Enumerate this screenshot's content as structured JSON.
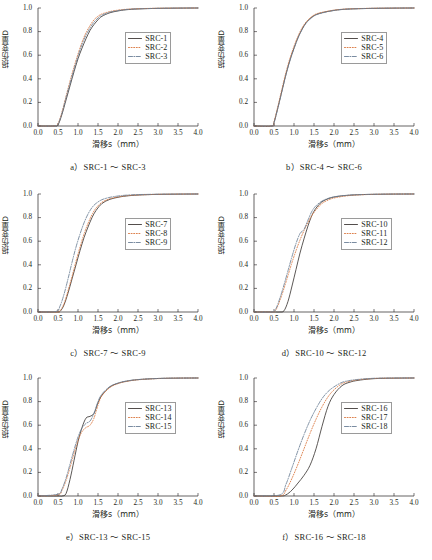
{
  "figure": {
    "axis": {
      "xlabel": "滑移s（mm）",
      "ylabel": "损伤变量D",
      "xticks": [
        "0.0",
        "0.5",
        "1.0",
        "1.5",
        "2.0",
        "2.5",
        "3.0",
        "3.5",
        "4.0"
      ],
      "yticks": [
        "0.0",
        "0.2",
        "0.4",
        "0.6",
        "0.8",
        "1.0"
      ],
      "xlim": [
        0.0,
        4.0
      ],
      "ylim": [
        0.0,
        1.0
      ]
    },
    "colors": {
      "series1": "#3f3a38",
      "series2": "#d9743a",
      "series3": "#6b7f96",
      "axis": "#231f20",
      "legend_border": "#9a9a9a"
    },
    "panels": [
      {
        "caption": "a）SRC-1 ～ SRC-3",
        "legend": [
          "SRC-1",
          "SRC-2",
          "SRC-3"
        ]
      },
      {
        "caption": "b）SRC-4 ～ SRC-6",
        "legend": [
          "SRC-4",
          "SRC-5",
          "SRC-6"
        ]
      },
      {
        "caption": "c）SRC-7 ～ SRC-9",
        "legend": [
          "SRC-7",
          "SRC-8",
          "SRC-9"
        ]
      },
      {
        "caption": "d）SRC-10 ～ SRC-12",
        "legend": [
          "SRC-10",
          "SRC-11",
          "SRC-12"
        ]
      },
      {
        "caption": "e）SRC-13 ～ SRC-15",
        "legend": [
          "SRC-13",
          "SRC-14",
          "SRC-15"
        ]
      },
      {
        "caption": "f）SRC-16 ～ SRC-18",
        "legend": [
          "SRC-16",
          "SRC-17",
          "SRC-18"
        ]
      }
    ]
  },
  "chart_data": [
    {
      "type": "line",
      "panel": "a",
      "title": "a）SRC-1 ～ SRC-3",
      "xlabel": "滑移s（mm）",
      "ylabel": "损伤变量D",
      "xlim": [
        0.0,
        4.0
      ],
      "ylim": [
        0.0,
        1.0
      ],
      "grid": false,
      "legend_position": "center-right",
      "x": [
        0.0,
        0.4,
        0.5,
        0.6,
        0.7,
        0.8,
        0.9,
        1.0,
        1.1,
        1.2,
        1.3,
        1.4,
        1.5,
        1.6,
        1.8,
        2.0,
        2.2,
        2.5,
        3.0,
        3.5,
        4.0
      ],
      "series": [
        {
          "name": "SRC-1",
          "style": "solid",
          "color": "#3f3a38",
          "values": [
            0.0,
            0.0,
            0.01,
            0.1,
            0.22,
            0.34,
            0.46,
            0.57,
            0.66,
            0.74,
            0.81,
            0.86,
            0.9,
            0.93,
            0.96,
            0.975,
            0.985,
            0.992,
            0.997,
            0.999,
            1.0
          ]
        },
        {
          "name": "SRC-2",
          "style": "dotted",
          "color": "#d9743a",
          "values": [
            0.0,
            0.0,
            0.02,
            0.12,
            0.25,
            0.38,
            0.5,
            0.61,
            0.71,
            0.79,
            0.85,
            0.9,
            0.93,
            0.95,
            0.97,
            0.982,
            0.989,
            0.994,
            0.998,
            0.999,
            1.0
          ]
        },
        {
          "name": "SRC-3",
          "style": "dashdot",
          "color": "#6b7f96",
          "values": [
            0.0,
            0.0,
            0.015,
            0.11,
            0.24,
            0.36,
            0.48,
            0.59,
            0.69,
            0.77,
            0.83,
            0.88,
            0.915,
            0.94,
            0.965,
            0.978,
            0.987,
            0.993,
            0.997,
            0.999,
            1.0
          ]
        }
      ]
    },
    {
      "type": "line",
      "panel": "b",
      "title": "b）SRC-4 ～ SRC-6",
      "xlabel": "滑移s（mm）",
      "ylabel": "损伤变量D",
      "xlim": [
        0.0,
        4.0
      ],
      "ylim": [
        0.0,
        1.0
      ],
      "grid": false,
      "legend_position": "center-right",
      "x": [
        0.0,
        0.45,
        0.5,
        0.6,
        0.7,
        0.8,
        0.9,
        1.0,
        1.1,
        1.2,
        1.3,
        1.4,
        1.5,
        1.6,
        1.8,
        2.0,
        2.2,
        2.5,
        3.0,
        3.5,
        4.0
      ],
      "series": [
        {
          "name": "SRC-4",
          "style": "solid",
          "color": "#3f3a38",
          "values": [
            0.0,
            0.0,
            0.03,
            0.16,
            0.3,
            0.44,
            0.56,
            0.66,
            0.75,
            0.82,
            0.875,
            0.91,
            0.935,
            0.95,
            0.968,
            0.98,
            0.988,
            0.993,
            0.997,
            0.999,
            1.0
          ]
        },
        {
          "name": "SRC-5",
          "style": "dotted",
          "color": "#d9743a",
          "values": [
            0.0,
            0.0,
            0.035,
            0.17,
            0.315,
            0.455,
            0.575,
            0.675,
            0.76,
            0.83,
            0.88,
            0.915,
            0.94,
            0.955,
            0.97,
            0.982,
            0.989,
            0.994,
            0.998,
            0.999,
            1.0
          ]
        },
        {
          "name": "SRC-6",
          "style": "dashdot",
          "color": "#6b7f96",
          "values": [
            0.0,
            0.0,
            0.025,
            0.155,
            0.295,
            0.435,
            0.555,
            0.655,
            0.745,
            0.815,
            0.87,
            0.905,
            0.932,
            0.948,
            0.966,
            0.979,
            0.987,
            0.993,
            0.997,
            0.999,
            1.0
          ]
        }
      ]
    },
    {
      "type": "line",
      "panel": "c",
      "title": "c）SRC-7 ～ SRC-9",
      "xlabel": "滑移s（mm）",
      "ylabel": "损伤变量D",
      "xlim": [
        0.0,
        4.0
      ],
      "ylim": [
        0.0,
        1.0
      ],
      "grid": false,
      "legend_position": "center-right",
      "x": [
        0.0,
        0.45,
        0.55,
        0.65,
        0.75,
        0.85,
        0.95,
        1.05,
        1.15,
        1.25,
        1.35,
        1.45,
        1.6,
        1.8,
        2.0,
        2.2,
        2.5,
        3.0,
        3.5,
        4.0
      ],
      "series": [
        {
          "name": "SRC-7",
          "style": "solid",
          "color": "#3f3a38",
          "values": [
            0.0,
            0.0,
            0.005,
            0.06,
            0.16,
            0.28,
            0.4,
            0.52,
            0.63,
            0.72,
            0.8,
            0.86,
            0.92,
            0.955,
            0.972,
            0.983,
            0.991,
            0.997,
            0.999,
            1.0
          ]
        },
        {
          "name": "SRC-8",
          "style": "dotted",
          "color": "#d9743a",
          "values": [
            0.0,
            0.0,
            0.01,
            0.07,
            0.18,
            0.3,
            0.43,
            0.55,
            0.66,
            0.75,
            0.825,
            0.88,
            0.93,
            0.96,
            0.975,
            0.985,
            0.992,
            0.997,
            0.999,
            1.0
          ]
        },
        {
          "name": "SRC-9",
          "style": "dashdot",
          "color": "#6b7f96",
          "values": [
            0.0,
            0.005,
            0.05,
            0.15,
            0.28,
            0.42,
            0.55,
            0.66,
            0.755,
            0.83,
            0.885,
            0.92,
            0.952,
            0.972,
            0.983,
            0.99,
            0.995,
            0.998,
            0.999,
            1.0
          ]
        }
      ]
    },
    {
      "type": "line",
      "panel": "d",
      "title": "d）SRC-10 ～ SRC-12",
      "xlabel": "滑移s（mm）",
      "ylabel": "损伤变量D",
      "xlim": [
        0.0,
        4.0
      ],
      "ylim": [
        0.0,
        1.0
      ],
      "grid": false,
      "legend_position": "center-right",
      "x": [
        0.0,
        0.45,
        0.55,
        0.65,
        0.75,
        0.85,
        0.95,
        1.05,
        1.15,
        1.25,
        1.35,
        1.45,
        1.55,
        1.7,
        1.9,
        2.1,
        2.4,
        2.8,
        3.4,
        4.0
      ],
      "series": [
        {
          "name": "SRC-10",
          "style": "solid",
          "color": "#3f3a38",
          "values": [
            0.0,
            0.0,
            0.0,
            0.0,
            0.01,
            0.09,
            0.22,
            0.36,
            0.5,
            0.62,
            0.73,
            0.82,
            0.88,
            0.935,
            0.965,
            0.98,
            0.99,
            0.996,
            0.999,
            1.0
          ]
        },
        {
          "name": "SRC-11",
          "style": "dotted",
          "color": "#d9743a",
          "values": [
            0.0,
            0.0,
            0.02,
            0.1,
            0.2,
            0.31,
            0.42,
            0.52,
            0.61,
            0.69,
            0.76,
            0.82,
            0.865,
            0.92,
            0.955,
            0.973,
            0.987,
            0.995,
            0.999,
            1.0
          ]
        },
        {
          "name": "SRC-12",
          "style": "dashdot",
          "color": "#6b7f96",
          "values": [
            0.0,
            0.0,
            0.03,
            0.12,
            0.23,
            0.35,
            0.47,
            0.58,
            0.665,
            0.7,
            0.78,
            0.855,
            0.9,
            0.94,
            0.968,
            0.981,
            0.991,
            0.996,
            0.999,
            1.0
          ]
        }
      ]
    },
    {
      "type": "line",
      "panel": "e",
      "title": "e）SRC-13 ～ SRC-15",
      "xlabel": "滑移s（mm）",
      "ylabel": "损伤变量D",
      "xlim": [
        0.0,
        4.0
      ],
      "ylim": [
        0.0,
        1.0
      ],
      "grid": false,
      "legend_position": "center-right",
      "x": [
        0.0,
        0.5,
        0.6,
        0.7,
        0.8,
        0.9,
        1.0,
        1.1,
        1.2,
        1.3,
        1.4,
        1.5,
        1.6,
        1.8,
        2.0,
        2.2,
        2.5,
        3.0,
        3.5,
        4.0
      ],
      "series": [
        {
          "name": "SRC-13",
          "style": "solid",
          "color": "#3f3a38",
          "values": [
            0.0,
            0.0,
            0.0,
            0.02,
            0.14,
            0.3,
            0.46,
            0.58,
            0.66,
            0.675,
            0.7,
            0.79,
            0.855,
            0.925,
            0.955,
            0.972,
            0.986,
            0.996,
            0.999,
            1.0
          ]
        },
        {
          "name": "SRC-14",
          "style": "dotted",
          "color": "#d9743a",
          "values": [
            0.0,
            0.01,
            0.05,
            0.13,
            0.24,
            0.36,
            0.47,
            0.545,
            0.58,
            0.6,
            0.66,
            0.77,
            0.85,
            0.92,
            0.952,
            0.97,
            0.985,
            0.995,
            0.999,
            1.0
          ]
        },
        {
          "name": "SRC-15",
          "style": "dashdot",
          "color": "#6b7f96",
          "values": [
            0.0,
            0.015,
            0.06,
            0.15,
            0.27,
            0.39,
            0.5,
            0.575,
            0.615,
            0.635,
            0.7,
            0.8,
            0.865,
            0.928,
            0.957,
            0.974,
            0.987,
            0.996,
            0.999,
            1.0
          ]
        }
      ]
    },
    {
      "type": "line",
      "panel": "f",
      "title": "f）SRC-16 ～ SRC-18",
      "xlabel": "滑移s（mm）",
      "ylabel": "损伤变量D",
      "xlim": [
        0.0,
        4.0
      ],
      "ylim": [
        0.0,
        1.0
      ],
      "grid": false,
      "legend_position": "center-right",
      "x": [
        0.0,
        0.65,
        0.8,
        0.95,
        1.1,
        1.25,
        1.4,
        1.55,
        1.7,
        1.85,
        2.0,
        2.2,
        2.4,
        2.6,
        2.9,
        3.2,
        3.6,
        4.0
      ],
      "series": [
        {
          "name": "SRC-16",
          "style": "solid",
          "color": "#3f3a38",
          "values": [
            0.0,
            0.0,
            0.01,
            0.05,
            0.11,
            0.175,
            0.26,
            0.4,
            0.59,
            0.76,
            0.86,
            0.935,
            0.965,
            0.98,
            0.992,
            0.997,
            0.999,
            1.0
          ]
        },
        {
          "name": "SRC-17",
          "style": "dotted",
          "color": "#d9743a",
          "values": [
            0.0,
            0.0,
            0.05,
            0.15,
            0.27,
            0.4,
            0.53,
            0.65,
            0.755,
            0.84,
            0.9,
            0.952,
            0.973,
            0.985,
            0.994,
            0.998,
            0.999,
            1.0
          ]
        },
        {
          "name": "SRC-18",
          "style": "dashdot",
          "color": "#6b7f96",
          "values": [
            0.0,
            0.01,
            0.1,
            0.24,
            0.385,
            0.52,
            0.64,
            0.74,
            0.825,
            0.885,
            0.925,
            0.963,
            0.979,
            0.988,
            0.996,
            0.999,
            1.0,
            1.0
          ]
        }
      ]
    }
  ]
}
